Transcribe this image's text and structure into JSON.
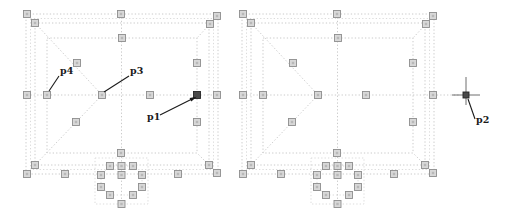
{
  "figure": {
    "canvas": {
      "width": 505,
      "height": 210,
      "background": "#ffffff"
    },
    "colors": {
      "line_light": "#bcbcbc",
      "line_lighter": "#d2d2d2",
      "marker_fill": "#d8d8d8",
      "marker_inner": "#b8b8b8",
      "marker_stroke": "#8e8e8e",
      "marker_dark_fill": "#4a4a4a",
      "marker_dark_stroke": "#262626",
      "annotation": "#1a1a1a",
      "crosshair": "#4a4a4a"
    },
    "labels": {
      "p1": "p1",
      "p2": "p2",
      "p3": "p3",
      "p4": "p4"
    },
    "template": {
      "outer_rect": [
        0,
        0,
        192,
        160
      ],
      "wall_rect_a": [
        4.5,
        4.5,
        183,
        151
      ],
      "wall_rect_b": [
        9,
        9,
        174,
        142
      ],
      "grid_rect": [
        21,
        24,
        150,
        115
      ],
      "cluster_rect": [
        69,
        144,
        53,
        46
      ],
      "center_h_line": [
        [
          1,
          81
        ],
        [
          194,
          81
        ]
      ],
      "center_v_line": [
        [
          95.5,
          0
        ],
        [
          95.5,
          190
        ]
      ],
      "diagonals": [
        [
          [
            9,
            9
          ],
          [
            76,
            81
          ]
        ],
        [
          [
            9,
            151
          ],
          [
            76,
            81
          ]
        ],
        [
          [
            184,
            10
          ],
          [
            171,
            24
          ]
        ],
        [
          [
            183,
            151
          ],
          [
            171,
            139
          ]
        ]
      ],
      "cluster_ring": [
        [
          84,
          152
        ],
        [
          107,
          152
        ],
        [
          116,
          161
        ],
        [
          116,
          173
        ],
        [
          107,
          181
        ],
        [
          84,
          181
        ],
        [
          75,
          173
        ],
        [
          75,
          161
        ]
      ],
      "markers_light": [
        [
          1,
          0
        ],
        [
          95,
          0
        ],
        [
          191,
          2
        ],
        [
          1,
          81
        ],
        [
          191,
          81
        ],
        [
          1,
          160
        ],
        [
          39,
          160
        ],
        [
          152,
          160
        ],
        [
          191,
          159
        ],
        [
          9,
          9
        ],
        [
          184,
          10
        ],
        [
          9,
          151
        ],
        [
          183,
          151
        ],
        [
          96,
          24
        ],
        [
          21,
          81
        ],
        [
          95,
          139
        ],
        [
          76,
          81
        ],
        [
          124,
          81
        ],
        [
          51,
          49
        ],
        [
          50,
          108
        ],
        [
          171,
          49
        ],
        [
          171,
          108
        ],
        [
          84,
          152
        ],
        [
          95.5,
          152
        ],
        [
          107,
          152
        ],
        [
          75,
          161
        ],
        [
          95.5,
          161
        ],
        [
          116,
          161
        ],
        [
          75,
          173
        ],
        [
          116,
          173
        ],
        [
          84,
          181
        ],
        [
          107,
          181
        ],
        [
          95.5,
          190
        ]
      ],
      "marker_p1": [
        171,
        81
      ],
      "marker_size": 7
    },
    "panels": [
      {
        "name": "plan-left",
        "origin": [
          26,
          14
        ],
        "has_p1_marker": true,
        "crosshair": null,
        "annotations": [
          {
            "id": "p4",
            "label_key": "p4",
            "text_pos": [
              34,
              60
            ],
            "line": [
              [
                23,
                77
              ],
              [
                33,
                62
              ]
            ],
            "arrow": false
          },
          {
            "id": "p3",
            "label_key": "p3",
            "text_pos": [
              104,
              60
            ],
            "line": [
              [
                78,
                78
              ],
              [
                103,
                62
              ]
            ],
            "arrow": false
          },
          {
            "id": "p1",
            "label_key": "p1",
            "text_pos": [
              121,
              106
            ],
            "line": [
              [
                134,
                101
              ],
              [
                168,
                84
              ]
            ],
            "arrow": true
          }
        ]
      },
      {
        "name": "plan-right",
        "origin": [
          242,
          14
        ],
        "has_p1_marker": false,
        "crosshair": {
          "center": [
            224,
            81
          ],
          "v": [
            [
              224,
              63
            ],
            [
              224,
              91
            ]
          ],
          "h": [
            [
              210,
              81
            ],
            [
              238,
              81
            ]
          ]
        },
        "annotations": [
          {
            "id": "p2",
            "label_key": "p2",
            "text_pos": [
              234,
              109
            ],
            "line": [
              [
                226,
                85
              ],
              [
                233,
                105
              ]
            ],
            "arrow": false
          }
        ]
      }
    ]
  }
}
